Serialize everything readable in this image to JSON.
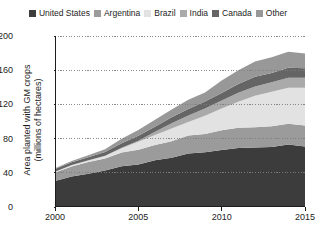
{
  "chart_data": {
    "type": "area",
    "stacked": true,
    "title": "",
    "subtitle": "",
    "xlabel": "",
    "ylabel": "Area planted with GM crops (millions of hectares)",
    "ylabel_lines": [
      "Area planted with GM crops",
      "(millions of hectares)"
    ],
    "grid": true,
    "grid_axis": "y",
    "legend_position": "top",
    "xlim": [
      2000,
      2015
    ],
    "ylim": [
      0,
      200
    ],
    "x": [
      2000,
      2001,
      2002,
      2003,
      2004,
      2005,
      2006,
      2007,
      2008,
      2009,
      2010,
      2011,
      2012,
      2013,
      2014,
      2015
    ],
    "xticks": [
      2000,
      2005,
      2010,
      2015
    ],
    "xtick_labels": [
      "2000",
      "2005",
      "2010",
      "2015"
    ],
    "yticks": [
      0,
      40,
      80,
      120,
      160,
      200
    ],
    "ytick_labels": [
      "0",
      "40",
      "80",
      "120",
      "160",
      "200"
    ],
    "series": [
      {
        "name": "United States",
        "color": "#3c3c3c",
        "values": [
          30.3,
          35.7,
          39.0,
          42.8,
          47.6,
          49.8,
          54.6,
          57.7,
          62.5,
          64.0,
          66.8,
          69.0,
          69.5,
          70.1,
          73.1,
          70.9
        ]
      },
      {
        "name": "Argentina",
        "color": "#9b9b9b",
        "values": [
          10.0,
          11.8,
          13.5,
          13.9,
          16.2,
          17.1,
          18.0,
          19.1,
          21.0,
          21.3,
          22.9,
          23.7,
          23.9,
          24.4,
          24.3,
          24.5
        ]
      },
      {
        "name": "Brazil",
        "color": "#e2e2e2",
        "values": [
          1.0,
          1.4,
          2.0,
          3.0,
          5.0,
          9.4,
          11.5,
          15.0,
          15.8,
          21.4,
          25.4,
          30.3,
          36.6,
          40.3,
          42.2,
          44.2
        ]
      },
      {
        "name": "India",
        "color": "#aaaaaa",
        "values": [
          0.0,
          0.1,
          0.1,
          0.1,
          0.5,
          1.3,
          3.8,
          6.2,
          7.6,
          8.4,
          9.4,
          10.6,
          10.8,
          11.0,
          11.6,
          11.6
        ]
      },
      {
        "name": "Canada",
        "color": "#656565",
        "values": [
          3.0,
          3.2,
          3.5,
          4.4,
          5.4,
          5.8,
          6.1,
          7.0,
          7.6,
          8.2,
          8.8,
          10.4,
          11.6,
          10.8,
          11.6,
          11.0
        ]
      },
      {
        "name": "Other",
        "color": "#989898",
        "values": [
          0.9,
          1.5,
          2.3,
          3.3,
          5.1,
          6.6,
          8.0,
          9.0,
          10.8,
          10.7,
          14.7,
          16.0,
          17.9,
          18.6,
          18.8,
          17.4
        ]
      }
    ],
    "totals": [
      45.2,
      53.7,
      60.4,
      67.5,
      79.8,
      90.0,
      102.0,
      114.0,
      125.3,
      134.0,
      148.0,
      160.0,
      170.3,
      175.2,
      181.6,
      179.6
    ]
  },
  "legend": {
    "items": [
      {
        "label": "United States",
        "color": "#3c3c3c"
      },
      {
        "label": "Argentina",
        "color": "#9b9b9b"
      },
      {
        "label": "Brazil",
        "color": "#e2e2e2"
      },
      {
        "label": "India",
        "color": "#aaaaaa"
      },
      {
        "label": "Canada",
        "color": "#656565"
      },
      {
        "label": "Other",
        "color": "#989898"
      }
    ]
  },
  "axes": {
    "y_title_line1": "Area planted with GM crops",
    "y_title_line2": "(millions of hectares)"
  }
}
